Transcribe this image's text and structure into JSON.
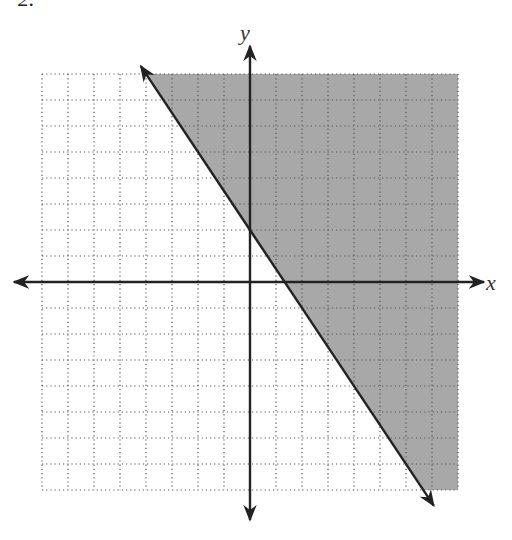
{
  "problem_number": "2.",
  "axis_labels": {
    "x": "x",
    "y": "y"
  },
  "colors": {
    "shade": "#a8a8a8",
    "grid": "#555555",
    "axis": "#222222",
    "line": "#222222"
  },
  "chart_data": {
    "type": "inequality-graph",
    "title": "",
    "xlabel": "x",
    "ylabel": "y",
    "xlim": [
      -8,
      8
    ],
    "ylim": [
      -8,
      8
    ],
    "grid": true,
    "grid_step": 1,
    "boundary_line": {
      "slope": -1.5,
      "y_intercept": 2,
      "x_intercept": 1.333,
      "style": "solid",
      "arrows": "both"
    },
    "inequality": "y >= -3/2 x + 2",
    "shaded_region": "above line (right side)"
  }
}
